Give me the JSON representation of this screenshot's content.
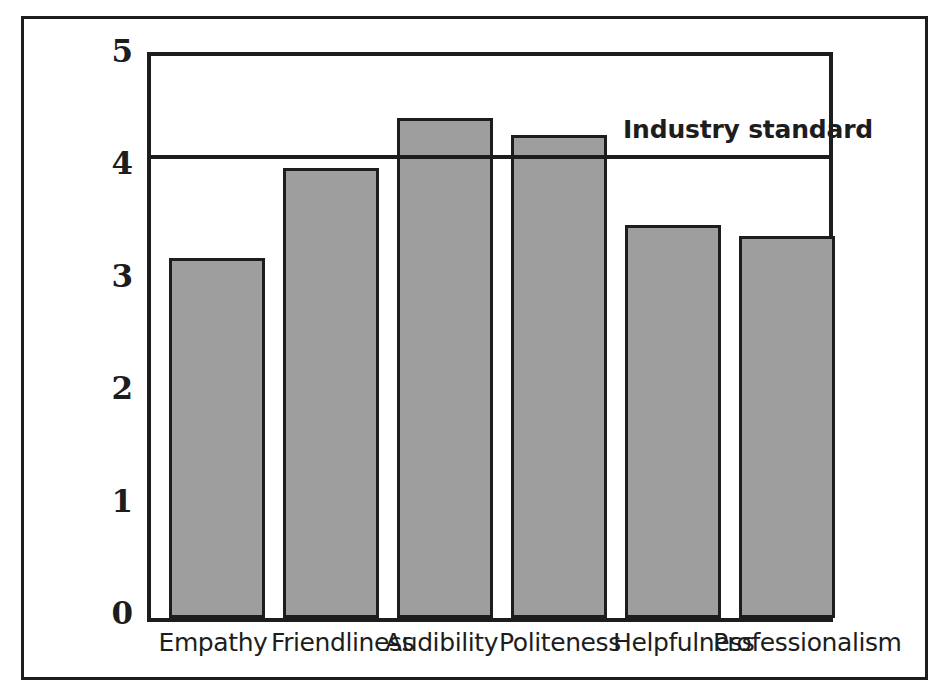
{
  "chart_data": {
    "type": "bar",
    "title": "",
    "subtitle": "",
    "xlabel": "",
    "ylabel": "",
    "categories": [
      "Empathy",
      "Friendliness",
      "Audibility",
      "Politeness",
      "Helpfulness",
      "Professionalism"
    ],
    "values": [
      3.2,
      4.0,
      4.45,
      4.3,
      3.5,
      3.4
    ],
    "series": [
      {
        "name": "Score",
        "values": [
          3.2,
          4.0,
          4.45,
          4.3,
          3.5,
          3.4
        ]
      }
    ],
    "ylim": [
      0,
      5
    ],
    "yticks": [
      0,
      1,
      2,
      3,
      4,
      5
    ],
    "ytick_labels": [
      "0",
      "1",
      "2",
      "3",
      "4",
      "5"
    ],
    "grid": false,
    "legend": false,
    "legend_position": "none",
    "annotations": [
      {
        "label": "Industry standard",
        "type": "horizontal-reference-line",
        "value": 4.08,
        "label_position": "above-right"
      }
    ],
    "colors": {
      "bar_fill": "#9e9e9e",
      "bar_stroke": "#1d1d1d",
      "axis": "#1d1d1d",
      "reference_line": "#1d1d1d",
      "background": "#ffffff",
      "frame": "#1d1d1d"
    }
  }
}
